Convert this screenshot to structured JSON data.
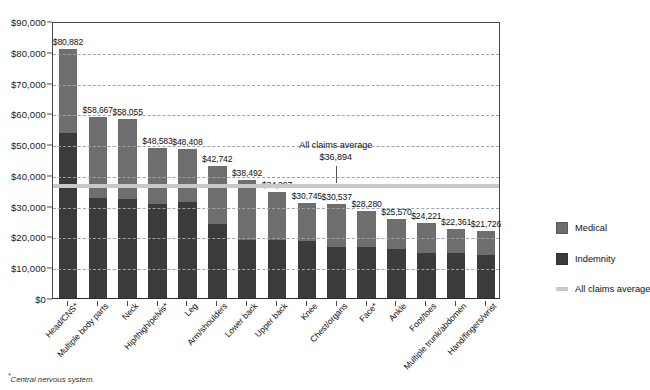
{
  "chart_data": {
    "type": "bar",
    "stacked": true,
    "title": "",
    "xlabel": "",
    "ylabel": "",
    "ylim": [
      0,
      90000
    ],
    "ytick_step": 10000,
    "ytick_labels": [
      "$0",
      "$10,000",
      "$20,000",
      "$30,000",
      "$40,000",
      "$50,000",
      "$60,000",
      "$70,000",
      "$80,000",
      "$90,000"
    ],
    "grid": "horizontal-dashed",
    "legend_position": "right",
    "categories": [
      "Head/CNS*",
      "Multiple body parts",
      "Neck",
      "Hip/thigh/pelvis*",
      "Leg",
      "Arm/shoulders",
      "Lower back",
      "Upper back",
      "Knee",
      "Chest/organs",
      "Face*",
      "Ankle",
      "Foot/toes",
      "Multiple trunk/abdomen",
      "Hand/fingers/wrist"
    ],
    "totals": [
      80882,
      58667,
      58055,
      48583,
      48408,
      42742,
      38492,
      34297,
      30745,
      30537,
      28280,
      25570,
      24221,
      22361,
      21726
    ],
    "total_labels": [
      "$80,882",
      "$58,667",
      "$58,055",
      "$48,583",
      "$48,408",
      "$42,742",
      "$38,492",
      "$34,297",
      "$30,745",
      "$30,537",
      "$28,280",
      "$25,570",
      "$24,221",
      "$22,361",
      "$21,726"
    ],
    "series": [
      {
        "name": "Indemnity",
        "color": "#3b3b3b",
        "values": [
          53600,
          32400,
          32300,
          30400,
          31100,
          23900,
          18700,
          18700,
          18500,
          16700,
          16700,
          15900,
          14700,
          14600,
          13900
        ]
      },
      {
        "name": "Medical",
        "color": "#6e6e6e",
        "values": [
          27282,
          26267,
          25755,
          18183,
          17308,
          18842,
          19792,
          15597,
          12245,
          13837,
          11580,
          9670,
          9521,
          7761,
          7826
        ]
      }
    ],
    "reference_line": {
      "label": "All claims average",
      "value": 36894,
      "value_label": "$36,894",
      "color": "#c9c9c9"
    }
  },
  "legend": {
    "items": [
      {
        "label": "Medical",
        "type": "swatch",
        "color": "#6e6e6e"
      },
      {
        "label": "Indemnity",
        "type": "swatch",
        "color": "#3b3b3b"
      },
      {
        "label": "All claims average",
        "type": "bar",
        "color": "#c9c9c9"
      }
    ]
  },
  "footnote": {
    "marker": "*",
    "text": "Central nervous system."
  }
}
